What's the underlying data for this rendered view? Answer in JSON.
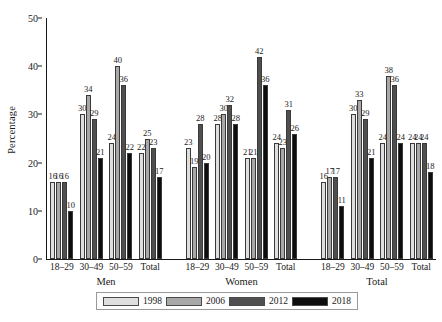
{
  "chart_data": {
    "type": "bar",
    "title": "",
    "xlabel": "",
    "ylabel": "Percentage",
    "ylim": [
      0,
      50
    ],
    "yticks": [
      0,
      10,
      20,
      30,
      40,
      50
    ],
    "grid": false,
    "legend_position": "bottom",
    "categories": [
      "18–29",
      "30–49",
      "50–59",
      "Total"
    ],
    "groups": [
      {
        "name": "Men",
        "categories": [
          "18–29",
          "30–49",
          "50–59",
          "Total"
        ],
        "series": [
          {
            "name": "1998",
            "values": [
              16,
              30,
              24,
              22
            ]
          },
          {
            "name": "2006",
            "values": [
              16,
              34,
              40,
              25
            ]
          },
          {
            "name": "2012",
            "values": [
              16,
              29,
              36,
              23
            ]
          },
          {
            "name": "2018",
            "values": [
              10,
              21,
              22,
              17
            ]
          }
        ]
      },
      {
        "name": "Women",
        "categories": [
          "18–29",
          "30–49",
          "50–59",
          "Total"
        ],
        "series": [
          {
            "name": "1998",
            "values": [
              23,
              28,
              21,
              24
            ]
          },
          {
            "name": "2006",
            "values": [
              19,
              30,
              21,
              23
            ]
          },
          {
            "name": "2012",
            "values": [
              28,
              32,
              42,
              31
            ]
          },
          {
            "name": "2018",
            "values": [
              20,
              28,
              36,
              26
            ]
          }
        ]
      },
      {
        "name": "Total",
        "categories": [
          "18–29",
          "30–49",
          "50–59",
          "Total"
        ],
        "series": [
          {
            "name": "1998",
            "values": [
              16,
              30,
              24,
              24
            ]
          },
          {
            "name": "2006",
            "values": [
              17,
              33,
              38,
              24
            ]
          },
          {
            "name": "2012",
            "values": [
              17,
              29,
              36,
              24
            ]
          },
          {
            "name": "2018",
            "values": [
              11,
              21,
              24,
              18
            ]
          }
        ]
      }
    ],
    "legend": [
      {
        "label": "1998",
        "color": "#dedede"
      },
      {
        "label": "2006",
        "color": "#a8a8a8"
      },
      {
        "label": "2012",
        "color": "#4f4f4f"
      },
      {
        "label": "2018",
        "color": "#0d0d0d"
      }
    ]
  }
}
